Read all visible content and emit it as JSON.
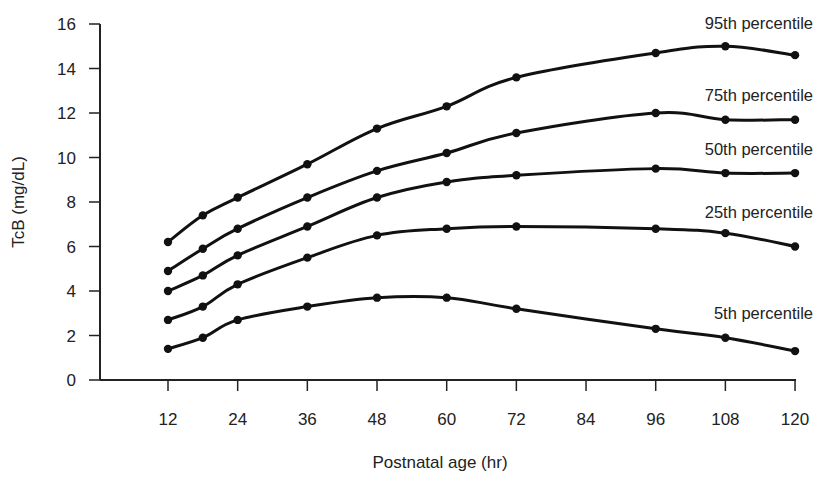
{
  "chart_data": {
    "type": "line",
    "title": "",
    "xlabel": "Postnatal age (hr)",
    "ylabel": "TcB (mg/dL)",
    "xlim": [
      0,
      120
    ],
    "ylim": [
      0,
      16
    ],
    "grid": false,
    "legend_position": "inline-right",
    "x_ticks": [
      12,
      24,
      36,
      48,
      60,
      72,
      84,
      96,
      108,
      120
    ],
    "y_ticks": [
      0,
      2,
      4,
      6,
      8,
      10,
      12,
      14,
      16
    ],
    "x": [
      12,
      18,
      24,
      36,
      48,
      60,
      72,
      96,
      108,
      120
    ],
    "series": [
      {
        "name": "95th percentile",
        "values": [
          6.2,
          7.4,
          8.2,
          9.7,
          11.3,
          12.3,
          13.6,
          14.7,
          15.0,
          14.6
        ]
      },
      {
        "name": "75th percentile",
        "values": [
          4.9,
          5.9,
          6.8,
          8.2,
          9.4,
          10.2,
          11.1,
          12.0,
          11.7,
          11.7
        ]
      },
      {
        "name": "50th percentile",
        "values": [
          4.0,
          4.7,
          5.6,
          6.9,
          8.2,
          8.9,
          9.2,
          9.5,
          9.3,
          9.3
        ]
      },
      {
        "name": "25th percentile",
        "values": [
          2.7,
          3.3,
          4.3,
          5.5,
          6.5,
          6.8,
          6.9,
          6.8,
          6.6,
          6.0
        ]
      },
      {
        "name": "5th percentile",
        "values": [
          1.4,
          1.9,
          2.7,
          3.3,
          3.7,
          3.7,
          3.2,
          2.3,
          1.9,
          1.3
        ]
      }
    ],
    "label_positions": [
      {
        "name": "95th percentile",
        "x": 813,
        "y": 29
      },
      {
        "name": "75th percentile",
        "x": 813,
        "y": 101
      },
      {
        "name": "50th percentile",
        "x": 813,
        "y": 155
      },
      {
        "name": "25th percentile",
        "x": 813,
        "y": 218
      },
      {
        "name": "5th percentile",
        "x": 813,
        "y": 319
      }
    ],
    "colors": {
      "line": "#111111",
      "axis": "#222222",
      "text": "#222222"
    }
  }
}
